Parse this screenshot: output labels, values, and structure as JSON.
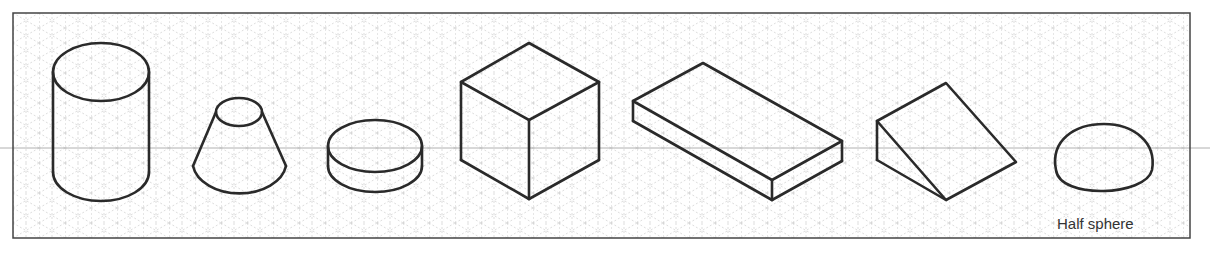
{
  "diagram": {
    "type": "isometric-solids",
    "grid": "isometric dotted grid",
    "shapes": [
      {
        "name": "cylinder"
      },
      {
        "name": "truncated-cone"
      },
      {
        "name": "disc"
      },
      {
        "name": "cube"
      },
      {
        "name": "rectangular-slab"
      },
      {
        "name": "wedge"
      },
      {
        "name": "half-sphere",
        "label": "Half sphere"
      }
    ]
  }
}
